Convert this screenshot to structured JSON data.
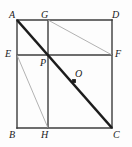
{
  "figure": {
    "kind": "geometry-diagram",
    "background_color": "#fdfdfd",
    "stroke_color": "#3c3c3c",
    "diagonal_color": "#1c1c1c",
    "thin_color": "#a9a9a9",
    "label_color": "#1a1a1a",
    "canvas": {
      "width": 132,
      "height": 147
    },
    "square": {
      "left": 17,
      "top": 20,
      "right": 112,
      "bottom": 128
    },
    "points": [
      {
        "id": "A",
        "label": "A",
        "x": 17,
        "y": 20,
        "label_x": 9,
        "label_y": 10,
        "marked": false
      },
      {
        "id": "G",
        "label": "G",
        "x": 48,
        "y": 20,
        "label_x": 41,
        "label_y": 10,
        "marked": false
      },
      {
        "id": "D",
        "label": "D",
        "x": 112,
        "y": 20,
        "label_x": 112,
        "label_y": 10,
        "marked": false
      },
      {
        "id": "E",
        "label": "E",
        "x": 17,
        "y": 55,
        "label_x": 5,
        "label_y": 49,
        "marked": false
      },
      {
        "id": "P",
        "label": "P",
        "x": 48,
        "y": 55,
        "label_x": 40,
        "label_y": 58,
        "marked": false
      },
      {
        "id": "O",
        "label": "O",
        "x": 74,
        "y": 81,
        "label_x": 75,
        "label_y": 69,
        "marked": true
      },
      {
        "id": "F",
        "label": "F",
        "x": 112,
        "y": 55,
        "label_x": 115,
        "label_y": 49,
        "marked": false
      },
      {
        "id": "B",
        "label": "B",
        "x": 17,
        "y": 128,
        "label_x": 9,
        "label_y": 130,
        "marked": false
      },
      {
        "id": "H",
        "label": "H",
        "x": 48,
        "y": 128,
        "label_x": 41,
        "label_y": 130,
        "marked": false
      },
      {
        "id": "C",
        "label": "C",
        "x": 112,
        "y": 128,
        "label_x": 113,
        "label_y": 130,
        "marked": false
      }
    ],
    "segments": [
      {
        "id": "AD",
        "from": "A",
        "to": "D",
        "style": "solid",
        "weight": 1.4
      },
      {
        "id": "DC",
        "from": "D",
        "to": "C",
        "style": "solid",
        "weight": 1.4
      },
      {
        "id": "CB",
        "from": "C",
        "to": "B",
        "style": "solid",
        "weight": 1.4
      },
      {
        "id": "BA",
        "from": "B",
        "to": "A",
        "style": "solid",
        "weight": 1.4
      },
      {
        "id": "EF",
        "from": "E",
        "to": "F",
        "style": "solid",
        "weight": 1.4
      },
      {
        "id": "GH",
        "from": "G",
        "to": "H",
        "style": "solid",
        "weight": 1.4
      },
      {
        "id": "EH",
        "from": "E",
        "to": "H",
        "style": "thin",
        "weight": 0.9
      },
      {
        "id": "GF",
        "from": "G",
        "to": "F",
        "style": "thin",
        "weight": 0.9
      },
      {
        "id": "AC",
        "from": "A",
        "to": "C",
        "style": "diagonal",
        "weight": 2.6
      }
    ]
  }
}
